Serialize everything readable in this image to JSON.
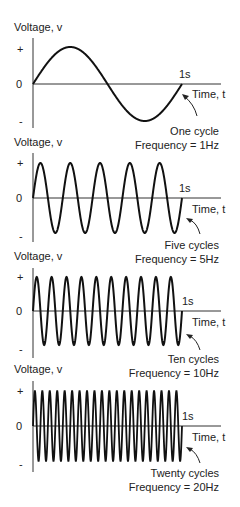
{
  "panels": [
    {
      "y_label": "Voltage, v",
      "plus": "+",
      "zero": "0",
      "minus": "-",
      "time_mark": "1s",
      "x_label": "Time, t",
      "cycles_label": "One cycle",
      "frequency_label": "Frequency = 1Hz",
      "cycles": 1
    },
    {
      "y_label": "Voltage, v",
      "plus": "+",
      "zero": "0",
      "minus": "-",
      "time_mark": "1s",
      "x_label": "Time, t",
      "cycles_label": "Five cycles",
      "frequency_label": "Frequency = 5Hz",
      "cycles": 5
    },
    {
      "y_label": "Voltage, v",
      "plus": "+",
      "zero": "0",
      "minus": "-",
      "time_mark": "1s",
      "x_label": "Time, t",
      "cycles_label": "Ten cycles",
      "frequency_label": "Frequency = 10Hz",
      "cycles": 10
    },
    {
      "y_label": "Voltage, v",
      "plus": "+",
      "zero": "0",
      "minus": "-",
      "time_mark": "1s",
      "x_label": "Time, t",
      "cycles_label": "Twenty cycles",
      "frequency_label": "Frequency = 20Hz",
      "cycles": 20
    }
  ]
}
